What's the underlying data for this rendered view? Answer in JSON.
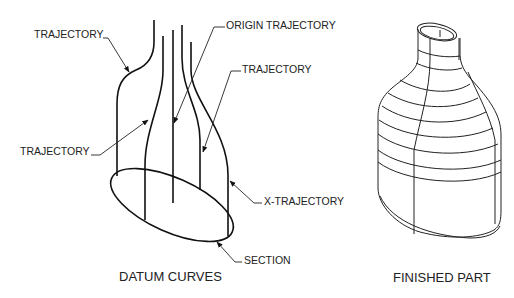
{
  "left_drawing": {
    "title": "DATUM CURVES",
    "labels": {
      "trajectory_top": "TRAJECTORY",
      "origin_trajectory": "ORIGIN TRAJECTORY",
      "trajectory_right": "TRAJECTORY",
      "trajectory_left": "TRAJECTORY",
      "x_trajectory": "X-TRAJECTORY",
      "section": "SECTION"
    }
  },
  "right_drawing": {
    "title": "FINISHED PART"
  },
  "colors": {
    "line": "#111111",
    "text": "#222222",
    "background": "#ffffff"
  }
}
